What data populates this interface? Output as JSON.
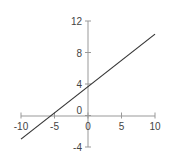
{
  "chart_data": {
    "type": "line",
    "title": "",
    "xlabel": "",
    "ylabel": "",
    "xlim": [
      -10,
      10
    ],
    "ylim": [
      -4,
      12
    ],
    "grid": false,
    "legend": null,
    "x_ticks": [
      "-10",
      "-5",
      "0",
      "5",
      "10"
    ],
    "y_ticks": [
      "12",
      "8",
      "4",
      "0",
      "-4"
    ],
    "series": [
      {
        "name": "line",
        "x": [
          -10,
          10
        ],
        "y": [
          -3,
          10.33
        ],
        "slope": 0.667,
        "intercept": 3.67,
        "color": "#333333"
      }
    ],
    "axis_color": "#999999"
  }
}
